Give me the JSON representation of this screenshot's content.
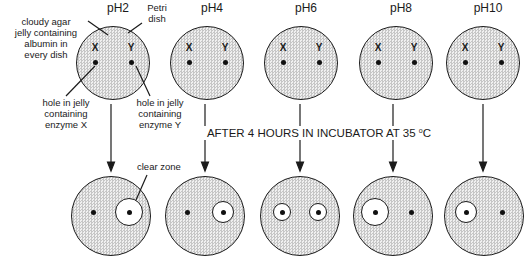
{
  "labels": {
    "cloudy_agar": [
      "cloudy agar",
      "jelly containing",
      "albumin in",
      "every dish"
    ],
    "petri_dish": [
      "Petri",
      "dish"
    ],
    "hole_x": [
      "hole in jelly",
      "containing",
      "enzyme X"
    ],
    "hole_y": [
      "hole in jelly",
      "containing",
      "enzyme Y"
    ],
    "clear_zone": "clear zone",
    "incubator": {
      "text": "AFTER 4 HOURS IN INCUBATOR AT 35 ",
      "degree": "o",
      "unit": "C"
    }
  },
  "top_row": [
    {
      "ph": "pH2",
      "holes": [
        "X",
        "Y"
      ]
    },
    {
      "ph": "pH4",
      "holes": [
        "X",
        "Y"
      ]
    },
    {
      "ph": "pH6",
      "holes": [
        "X",
        "Y"
      ]
    },
    {
      "ph": "pH8",
      "holes": [
        "X",
        "Y"
      ]
    },
    {
      "ph": "pH10",
      "holes": [
        "X",
        "Y"
      ]
    }
  ],
  "bottom_row": [
    {
      "ph": "pH2",
      "zones": {
        "X": "none",
        "Y": "large"
      }
    },
    {
      "ph": "pH4",
      "zones": {
        "X": "none",
        "Y": "medium"
      }
    },
    {
      "ph": "pH6",
      "zones": {
        "X": "small",
        "Y": "small"
      }
    },
    {
      "ph": "pH8",
      "zones": {
        "X": "large",
        "Y": "none"
      }
    },
    {
      "ph": "pH10",
      "zones": {
        "X": "medium",
        "Y": "none"
      }
    }
  ],
  "colors": {
    "agar_fill": "#c6c6c6",
    "clear_zone": "#ffffff",
    "ink": "#1a1a1a"
  }
}
